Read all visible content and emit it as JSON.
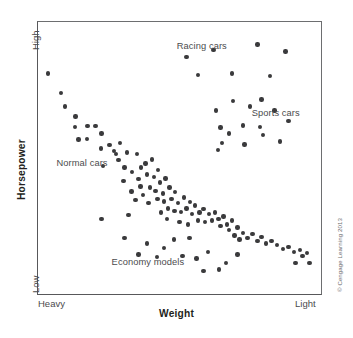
{
  "figure": {
    "title": "",
    "copyright": "© Cengage Learning 2013"
  },
  "axes": {
    "x_title": "Weight",
    "y_title": "Horsepower",
    "x_tick_low": "Heavy",
    "x_tick_high": "Light",
    "y_tick_low": "Low",
    "y_tick_high": "High"
  },
  "annotations": [
    {
      "text": "Racing cars",
      "x": 49.0,
      "y": 7.0
    },
    {
      "text": "Sports cars",
      "x": 75.5,
      "y": 31.5
    },
    {
      "text": "Normal cars",
      "x": 6.5,
      "y": 50.0
    },
    {
      "text": "Economy models",
      "x": 26.0,
      "y": 86.5
    }
  ],
  "chart_data": {
    "type": "scatter",
    "title": "",
    "xlabel": "Weight",
    "ylabel": "Horsepower",
    "xlim": [
      "Heavy",
      "Light"
    ],
    "ylim": [
      "Low",
      "High"
    ],
    "grid": false,
    "legend": "none",
    "note": "x/y given as percent of plot area; x increases toward Light, y increases downward (lower horsepower)",
    "series": [
      {
        "name": "cars",
        "points": [
          [
            3.5,
            19.0
          ],
          [
            8.2,
            26.2
          ],
          [
            13.2,
            34.8
          ],
          [
            13.0,
            38.5
          ],
          [
            17.5,
            38.3
          ],
          [
            20.3,
            38.3
          ],
          [
            14.3,
            43.2
          ],
          [
            17.3,
            43.0
          ],
          [
            22.2,
            46.5
          ],
          [
            25.3,
            45.2
          ],
          [
            26.8,
            47.5
          ],
          [
            28.5,
            50.8
          ],
          [
            23.0,
            53.0
          ],
          [
            30.5,
            53.5
          ],
          [
            33.3,
            55.2
          ],
          [
            30.2,
            58.5
          ],
          [
            35.5,
            57.8
          ],
          [
            38.5,
            56.0
          ],
          [
            36.2,
            60.5
          ],
          [
            39.5,
            60.8
          ],
          [
            33.0,
            62.3
          ],
          [
            37.0,
            63.5
          ],
          [
            41.5,
            62.2
          ],
          [
            34.5,
            65.5
          ],
          [
            39.0,
            66.5
          ],
          [
            42.2,
            65.0
          ],
          [
            44.2,
            63.0
          ],
          [
            40.3,
            50.5
          ],
          [
            42.5,
            54.5
          ],
          [
            45.0,
            57.5
          ],
          [
            43.2,
            59.0
          ],
          [
            46.5,
            60.8
          ],
          [
            44.5,
            66.0
          ],
          [
            47.2,
            65.0
          ],
          [
            48.5,
            62.5
          ],
          [
            49.5,
            66.5
          ],
          [
            51.5,
            64.5
          ],
          [
            46.0,
            68.5
          ],
          [
            48.2,
            69.5
          ],
          [
            50.5,
            69.8
          ],
          [
            52.5,
            68.5
          ],
          [
            53.8,
            66.2
          ],
          [
            55.5,
            67.5
          ],
          [
            54.5,
            70.5
          ],
          [
            57.0,
            70.0
          ],
          [
            58.5,
            68.8
          ],
          [
            60.5,
            70.5
          ],
          [
            56.5,
            73.0
          ],
          [
            59.0,
            73.5
          ],
          [
            61.5,
            73.0
          ],
          [
            62.5,
            70.0
          ],
          [
            63.8,
            72.5
          ],
          [
            65.5,
            71.5
          ],
          [
            64.5,
            75.0
          ],
          [
            66.8,
            74.5
          ],
          [
            68.5,
            73.0
          ],
          [
            67.5,
            76.5
          ],
          [
            70.5,
            75.5
          ],
          [
            69.5,
            78.5
          ],
          [
            72.5,
            77.5
          ],
          [
            71.2,
            80.0
          ],
          [
            74.0,
            79.5
          ],
          [
            75.8,
            78.0
          ],
          [
            77.5,
            80.5
          ],
          [
            79.0,
            79.0
          ],
          [
            80.5,
            81.5
          ],
          [
            82.5,
            80.5
          ],
          [
            84.5,
            82.0
          ],
          [
            86.5,
            83.5
          ],
          [
            88.5,
            82.8
          ],
          [
            90.5,
            84.5
          ],
          [
            92.5,
            83.8
          ],
          [
            93.5,
            86.0
          ],
          [
            95.0,
            85.0
          ],
          [
            91.0,
            88.5
          ],
          [
            96.0,
            88.5
          ],
          [
            27.5,
            48.5
          ],
          [
            31.5,
            48.0
          ],
          [
            29.0,
            44.5
          ],
          [
            35.0,
            48.5
          ],
          [
            38.0,
            52.0
          ],
          [
            41.0,
            57.0
          ],
          [
            36.5,
            53.5
          ],
          [
            43.5,
            70.0
          ],
          [
            45.5,
            72.5
          ],
          [
            50.0,
            73.5
          ],
          [
            53.0,
            74.5
          ],
          [
            22.5,
            41.0
          ],
          [
            9.5,
            31.0
          ],
          [
            52.5,
            12.8
          ],
          [
            62.0,
            10.2
          ],
          [
            77.5,
            8.3
          ],
          [
            87.5,
            10.8
          ],
          [
            56.5,
            19.5
          ],
          [
            68.5,
            19.0
          ],
          [
            82.0,
            19.8
          ],
          [
            69.0,
            29.0
          ],
          [
            79.0,
            28.5
          ],
          [
            63.0,
            32.5
          ],
          [
            75.0,
            31.0
          ],
          [
            83.5,
            32.5
          ],
          [
            64.5,
            38.8
          ],
          [
            72.5,
            38.0
          ],
          [
            78.5,
            38.5
          ],
          [
            88.5,
            36.5
          ],
          [
            65.0,
            44.5
          ],
          [
            67.5,
            41.0
          ],
          [
            79.5,
            41.5
          ],
          [
            85.5,
            44.0
          ],
          [
            63.5,
            47.0
          ],
          [
            73.0,
            45.0
          ],
          [
            22.5,
            72.5
          ],
          [
            32.0,
            71.0
          ],
          [
            30.5,
            79.5
          ],
          [
            38.5,
            81.5
          ],
          [
            44.5,
            83.0
          ],
          [
            35.5,
            85.5
          ],
          [
            48.0,
            80.0
          ],
          [
            53.5,
            79.5
          ],
          [
            42.0,
            86.5
          ],
          [
            51.0,
            86.0
          ],
          [
            60.0,
            84.5
          ],
          [
            66.5,
            88.5
          ],
          [
            58.5,
            91.5
          ],
          [
            64.0,
            91.0
          ],
          [
            70.5,
            85.5
          ],
          [
            56.0,
            87.0
          ]
        ]
      }
    ]
  }
}
